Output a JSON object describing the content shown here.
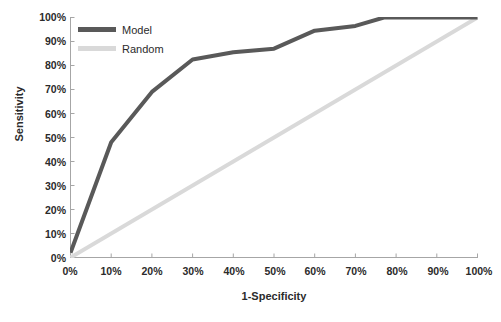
{
  "chart_data": {
    "type": "line",
    "title": "",
    "xlabel": "1-Specificity",
    "ylabel": "Sensitivity",
    "xlim": [
      0,
      100
    ],
    "ylim": [
      0,
      100
    ],
    "grid": false,
    "legend_position": "top-left",
    "xtick_labels": [
      "0%",
      "10%",
      "20%",
      "30%",
      "40%",
      "50%",
      "60%",
      "70%",
      "80%",
      "90%",
      "100%"
    ],
    "ytick_labels": [
      "0%",
      "10%",
      "20%",
      "30%",
      "40%",
      "50%",
      "60%",
      "70%",
      "80%",
      "90%",
      "100%"
    ],
    "xticks": [
      0,
      10,
      20,
      30,
      40,
      50,
      60,
      70,
      80,
      90,
      100
    ],
    "yticks": [
      0,
      10,
      20,
      30,
      40,
      50,
      60,
      70,
      80,
      90,
      100
    ],
    "series": [
      {
        "name": "Model",
        "color": "#595959",
        "width": 4,
        "x": [
          0,
          10,
          20,
          30,
          40,
          50,
          60,
          70,
          77,
          100
        ],
        "values": [
          2,
          48,
          69,
          82.5,
          85.5,
          87,
          94.5,
          96.5,
          100,
          100
        ]
      },
      {
        "name": "Random",
        "color": "#d9d9d9",
        "width": 4,
        "x": [
          0,
          100
        ],
        "values": [
          0,
          100
        ]
      }
    ]
  },
  "colors": {
    "model": "#595959",
    "random": "#d9d9d9",
    "axis": "#a6a6a6",
    "text": "#2b2b2b"
  }
}
